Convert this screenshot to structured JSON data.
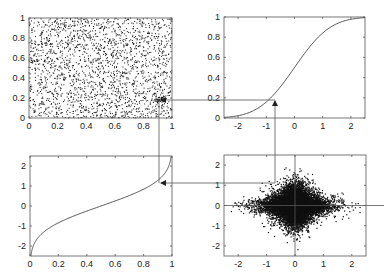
{
  "figure": {
    "colors": {
      "frame": "#555555",
      "curve": "#444444",
      "points": "#111111",
      "background": "#ffffff"
    }
  },
  "chart_data": [
    {
      "id": "top-left",
      "type": "scatter",
      "title": "",
      "xlabel": "",
      "ylabel": "",
      "xlim": [
        0,
        1
      ],
      "ylim": [
        0,
        1
      ],
      "xticks": [
        "0",
        "0.2",
        "0.4",
        "0.6",
        "0.8",
        "1"
      ],
      "yticks": [
        "0",
        "0.2",
        "0.4",
        "0.6",
        "0.8",
        "1"
      ],
      "distribution": "uniform on unit square",
      "n_points_approx": 2000,
      "highlight_point": [
        0.92,
        0.18
      ],
      "grid": false
    },
    {
      "id": "top-right",
      "type": "line",
      "title": "",
      "xlabel": "",
      "ylabel": "",
      "xlim": [
        -2.5,
        2.5
      ],
      "ylim": [
        0,
        1
      ],
      "xticks": [
        "-2",
        "-1",
        "0",
        "1",
        "2"
      ],
      "yticks": [
        "0",
        "0.2",
        "0.4",
        "0.6",
        "0.8",
        "1"
      ],
      "function": "standard normal CDF",
      "x": [
        -2.5,
        -2,
        -1.5,
        -1,
        -0.5,
        0,
        0.5,
        1,
        1.5,
        2,
        2.5
      ],
      "y": [
        0.006,
        0.023,
        0.067,
        0.159,
        0.309,
        0.5,
        0.691,
        0.841,
        0.933,
        0.977,
        0.994
      ],
      "marker": {
        "x": -0.9,
        "y": 0.18
      },
      "grid": false
    },
    {
      "id": "bottom-left",
      "type": "line",
      "title": "",
      "xlabel": "",
      "ylabel": "",
      "xlim": [
        0,
        1
      ],
      "ylim": [
        -2.5,
        2.5
      ],
      "xticks": [
        "0",
        "0.2",
        "0.4",
        "0.6",
        "0.8",
        "1"
      ],
      "yticks": [
        "-2",
        "-1",
        "0",
        "1",
        "2"
      ],
      "function": "inverse standard normal CDF (quantile)",
      "x": [
        0.006,
        0.023,
        0.067,
        0.159,
        0.309,
        0.5,
        0.691,
        0.841,
        0.933,
        0.977,
        0.994
      ],
      "y": [
        -2.5,
        -2,
        -1.5,
        -1,
        -0.5,
        0,
        0.5,
        1,
        1.5,
        2,
        2.5
      ],
      "marker": {
        "x": 0.92,
        "y": 1.2
      },
      "grid": false
    },
    {
      "id": "bottom-right",
      "type": "scatter",
      "title": "",
      "xlabel": "",
      "ylabel": "",
      "xlim": [
        -2.5,
        2.5
      ],
      "ylim": [
        -2.5,
        2.5
      ],
      "xticks": [
        "-2",
        "-1",
        "0",
        "1",
        "2"
      ],
      "yticks": [
        "-2",
        "-1",
        "0",
        "1",
        "2"
      ],
      "distribution": "dense star-shaped cloud centered at origin, cross-shaped spread",
      "n_points_approx": 10000,
      "reference_lines": {
        "x": 0,
        "y": 0
      },
      "highlight_point": [
        -0.9,
        1.2
      ],
      "grid": false
    }
  ],
  "connectors": [
    {
      "from": "top-left highlight",
      "to": "top-right curve",
      "direction": "horizontal",
      "arrow": "into top-left"
    },
    {
      "from": "bottom-right",
      "to": "top-right curve",
      "direction": "vertical",
      "arrow": "up"
    },
    {
      "from": "top-left",
      "to": "bottom-left curve",
      "direction": "vertical"
    },
    {
      "from": "bottom-right",
      "to": "bottom-left curve",
      "direction": "horizontal",
      "arrow": "left"
    }
  ]
}
